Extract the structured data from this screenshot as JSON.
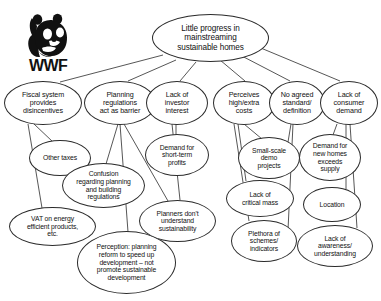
{
  "diagram": {
    "title": "Little progress in mainstreaming sustainable homes",
    "type": "problem-tree",
    "background_color": "#ffffff",
    "line_color": "#2b2b2b"
  },
  "logo": {
    "name": "wwf-panda-logo",
    "wordmark": "WWF"
  },
  "nodes": [
    {
      "id": "root",
      "label": "Little progress in\nmainstreaming\nsustainable homes",
      "level": 0,
      "x": 152,
      "y": 14,
      "w": 117,
      "h": 48
    },
    {
      "id": "fiscal",
      "label": "Fiscal system\nprovides\ndisincentives",
      "level": 1,
      "x": 4,
      "y": 81,
      "w": 78,
      "h": 44
    },
    {
      "id": "planning",
      "label": "Planning\nregulations\nact as barrier",
      "level": 1,
      "x": 84,
      "y": 81,
      "w": 72,
      "h": 44
    },
    {
      "id": "investor",
      "label": "Lack of\ninvestor\ninterest",
      "level": 1,
      "x": 146,
      "y": 81,
      "w": 62,
      "h": 44
    },
    {
      "id": "costs",
      "label": "Perceives\nhigh/extra\ncosts",
      "level": 1,
      "x": 213,
      "y": 81,
      "w": 62,
      "h": 44
    },
    {
      "id": "standard",
      "label": "No agreed\nstandard/\ndefinition",
      "level": 1,
      "x": 269,
      "y": 81,
      "w": 56,
      "h": 44
    },
    {
      "id": "consumer",
      "label": "Lack of\nconsumer\ndemand",
      "level": 1,
      "x": 320,
      "y": 81,
      "w": 58,
      "h": 44
    },
    {
      "id": "othertaxes",
      "label": "Other taxes",
      "level": 2,
      "x": 29,
      "y": 140,
      "w": 62,
      "h": 36
    },
    {
      "id": "confusion",
      "label": "Confusion\nregarding planning\nand building\nregulations",
      "level": 2,
      "x": 62,
      "y": 163,
      "w": 83,
      "h": 45
    },
    {
      "id": "vat",
      "label": "VAT on energy\nefficient products,\netc.",
      "level": 2,
      "x": 9,
      "y": 207,
      "w": 87,
      "h": 39
    },
    {
      "id": "perception",
      "label": "Perception: planning\nreform to speed up\ndevelopment – not\npromote sustainable\ndevelopment",
      "level": 2,
      "x": 77,
      "y": 231,
      "w": 99,
      "h": 63
    },
    {
      "id": "shortterm",
      "label": "Demand for\nshort-term\nprofits",
      "level": 2,
      "x": 145,
      "y": 134,
      "w": 64,
      "h": 42
    },
    {
      "id": "planners",
      "label": "Planners don't\nunderstand\nsustainability",
      "level": 2,
      "x": 139,
      "y": 200,
      "w": 77,
      "h": 42
    },
    {
      "id": "demo",
      "label": "Small-scale\ndemo\nprojects",
      "level": 2,
      "x": 238,
      "y": 137,
      "w": 62,
      "h": 42
    },
    {
      "id": "criticalmass",
      "label": "Lack of\ncritical mass",
      "level": 2,
      "x": 226,
      "y": 180,
      "w": 68,
      "h": 37
    },
    {
      "id": "plethora",
      "label": "Plethora of\nschemes/\nindicators",
      "level": 2,
      "x": 231,
      "y": 220,
      "w": 66,
      "h": 42
    },
    {
      "id": "newhomes",
      "label": "Demand for\nnew homes\nexceeds\nsupply",
      "level": 2,
      "x": 299,
      "y": 134,
      "w": 62,
      "h": 47
    },
    {
      "id": "location",
      "label": "Location",
      "level": 2,
      "x": 303,
      "y": 187,
      "w": 58,
      "h": 35
    },
    {
      "id": "awareness",
      "label": "Lack of\nawareness/\nunderstanding",
      "level": 2,
      "x": 297,
      "y": 225,
      "w": 76,
      "h": 42
    }
  ],
  "edges": [
    {
      "from": "root",
      "to": "fiscal",
      "x1": 163,
      "y1": 55,
      "x2": 60,
      "y2": 82
    },
    {
      "from": "root",
      "to": "planning",
      "x1": 176,
      "y1": 60,
      "x2": 128,
      "y2": 81
    },
    {
      "from": "root",
      "to": "investor",
      "x1": 196,
      "y1": 62,
      "x2": 180,
      "y2": 81
    },
    {
      "from": "root",
      "to": "costs",
      "x1": 220,
      "y1": 60,
      "x2": 245,
      "y2": 81
    },
    {
      "from": "root",
      "to": "standard",
      "x1": 238,
      "y1": 54,
      "x2": 290,
      "y2": 81
    },
    {
      "from": "root",
      "to": "consumer",
      "x1": 256,
      "y1": 46,
      "x2": 340,
      "y2": 81
    },
    {
      "from": "fiscal",
      "to": "othertaxes",
      "x1": 34,
      "y1": 124,
      "x2": 53,
      "y2": 142
    },
    {
      "from": "fiscal",
      "to": "vat",
      "x1": 28,
      "y1": 124,
      "x2": 42,
      "y2": 208
    },
    {
      "from": "planning",
      "to": "confusion",
      "x1": 118,
      "y1": 124,
      "x2": 106,
      "y2": 164
    },
    {
      "from": "planning",
      "to": "perception",
      "x1": 120,
      "y1": 124,
      "x2": 128,
      "y2": 232
    },
    {
      "from": "planning",
      "to": "planners",
      "x1": 124,
      "y1": 124,
      "x2": 168,
      "y2": 201
    },
    {
      "from": "investor",
      "to": "shortterm",
      "x1": 176,
      "y1": 124,
      "x2": 176,
      "y2": 135
    },
    {
      "from": "investor",
      "to": "planners",
      "x1": 172,
      "y1": 124,
      "x2": 180,
      "y2": 200
    },
    {
      "from": "costs",
      "to": "demo",
      "x1": 244,
      "y1": 124,
      "x2": 262,
      "y2": 139
    },
    {
      "from": "costs",
      "to": "criticalmass",
      "x1": 238,
      "y1": 124,
      "x2": 246,
      "y2": 181
    },
    {
      "from": "costs",
      "to": "plethora",
      "x1": 234,
      "y1": 124,
      "x2": 249,
      "y2": 221
    },
    {
      "from": "standard",
      "to": "demo",
      "x1": 291,
      "y1": 124,
      "x2": 288,
      "y2": 142
    },
    {
      "from": "standard",
      "to": "plethora",
      "x1": 293,
      "y1": 124,
      "x2": 288,
      "y2": 230
    },
    {
      "from": "consumer",
      "to": "newhomes",
      "x1": 337,
      "y1": 124,
      "x2": 333,
      "y2": 135
    },
    {
      "from": "consumer",
      "to": "location",
      "x1": 346,
      "y1": 124,
      "x2": 346,
      "y2": 189
    },
    {
      "from": "consumer",
      "to": "awareness",
      "x1": 350,
      "y1": 124,
      "x2": 357,
      "y2": 228
    }
  ]
}
